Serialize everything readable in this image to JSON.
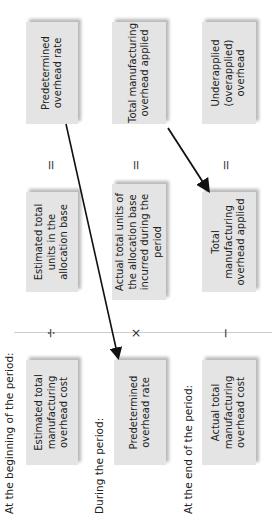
{
  "rows": [
    {
      "label": "At the beginning of the period:",
      "left_box": "Estimated total manufacturing overhead cost",
      "operator": "÷",
      "middle_box": "Estimated total units in the allocation base",
      "equals": "=",
      "right_box": "Predetermined overhead rate"
    },
    {
      "label": "During the period:",
      "left_box": "Predetermined overhead rate",
      "operator": "×",
      "middle_box": "Actual total units of the allocation base incurred during the period",
      "equals": "=",
      "right_box": "Total manufacturing overhead applied"
    },
    {
      "label": "At the end of the period:",
      "left_box": "Actual total manufacturing overhead cost",
      "operator": "−",
      "middle_box": "Total manufacturing overhead applied",
      "equals": "=",
      "right_box": "Underapplied (overapplied) overhead"
    }
  ],
  "colors": {
    "box": "#e4e4e4",
    "arrow": "#111111",
    "divider": "#cccccc"
  }
}
